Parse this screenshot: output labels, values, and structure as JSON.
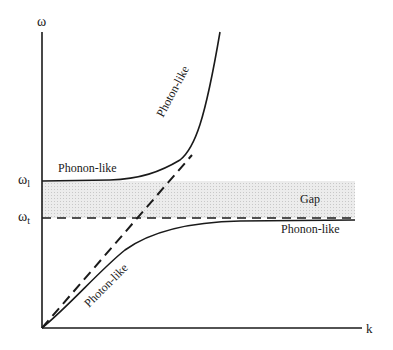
{
  "diagram": {
    "axes": {
      "y_label": "ω",
      "x_label": "k",
      "y_ticks": [
        {
          "label": "ω",
          "sub": "l",
          "y": 181
        },
        {
          "label": "ω",
          "sub": "t",
          "y": 218
        }
      ]
    },
    "labels": {
      "upper_phonon": "Phonon-like",
      "upper_photon": "Photon-like",
      "lower_phonon": "Phonon-like",
      "lower_photon": "Photon-like",
      "gap": "Gap"
    },
    "colors": {
      "line": "#1a1a1a",
      "gap_fill": "#e4e4e4"
    }
  }
}
